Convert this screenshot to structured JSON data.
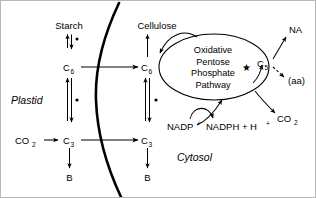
{
  "figure": {
    "type": "biochemical-pathway-diagram",
    "background_color": "#ffffff",
    "line_color": "#000000",
    "border_color": "#b8b8b8"
  },
  "compartments": [
    {
      "id": "plastid",
      "label": "Plastid"
    },
    {
      "id": "cytosol",
      "label": "Cytosol"
    }
  ],
  "membrane": {
    "name": "plastid-envelope",
    "style": "thick-curved-arc"
  },
  "metabolites": {
    "starch": "Starch",
    "cellulose": "Cellulose",
    "plastid_c6": "C",
    "plastid_c6_sub": "6",
    "plastid_c3": "C",
    "plastid_c3_sub": "3",
    "plastid_b": "B",
    "cytosol_c6": "C",
    "cytosol_c6_sub": "6",
    "cytosol_c3": "C",
    "cytosol_c3_sub": "3",
    "cytosol_b": "B",
    "c5": "C",
    "c5_sub": "5",
    "co2_in": "CO",
    "co2_in_sub": "2",
    "co2_out": "CO",
    "co2_out_sub": "2",
    "na": "NA",
    "aa": "(aa)"
  },
  "pathway": {
    "oval_label_lines": [
      "Oxidative",
      "Pentose",
      "Phosphate",
      "Pathway"
    ],
    "star_marker": "★"
  },
  "cofactors": {
    "nadp_base": "NADP",
    "nadp_charge": "+",
    "nadph_base": "NADPH + H",
    "nadph_charge": "+"
  },
  "markers": {
    "asterisk_dot": "•",
    "starch_marker": "•",
    "plastid_c6_c3_marker": "•",
    "cytosol_c6_c3_marker": "•",
    "membrane_transport_marker": "•"
  },
  "arrows": [
    {
      "name": "starch-to-c6-reversible",
      "from": "Starch",
      "to": "C6",
      "style": "double-reversible",
      "compartment": "plastid"
    },
    {
      "name": "plastid-c6-to-c3-reversible",
      "from": "C6",
      "to": "C3",
      "style": "double-reversible",
      "compartment": "plastid"
    },
    {
      "name": "co2-to-c3",
      "from": "CO2",
      "to": "C3",
      "style": "single",
      "compartment": "plastid"
    },
    {
      "name": "plastid-c3-to-b",
      "from": "C3",
      "to": "B",
      "style": "single",
      "compartment": "plastid"
    },
    {
      "name": "plastid-c6-to-cytosol-c6",
      "from": "C6",
      "to": "C6",
      "style": "single-transport",
      "compartment": "membrane"
    },
    {
      "name": "plastid-c3-to-cytosol-c3",
      "from": "C3",
      "to": "C3",
      "style": "single-transport",
      "compartment": "membrane"
    },
    {
      "name": "cytosol-c6-to-cellulose",
      "from": "C6",
      "to": "Cellulose",
      "style": "single",
      "compartment": "cytosol"
    },
    {
      "name": "cytosol-c6-to-c3-reversible",
      "from": "C6",
      "to": "C3",
      "style": "double-reversible",
      "compartment": "cytosol"
    },
    {
      "name": "cytosol-c3-to-b",
      "from": "C3",
      "to": "B",
      "style": "single",
      "compartment": "cytosol"
    },
    {
      "name": "c6-into-oppp",
      "from": "C6",
      "to": "Oxidative Pentose Phosphate Pathway",
      "style": "curved",
      "compartment": "cytosol"
    },
    {
      "name": "oppp-to-c5",
      "from": "Oxidative Pentose Phosphate Pathway",
      "to": "C5",
      "style": "curved",
      "compartment": "cytosol"
    },
    {
      "name": "c3-into-oppp",
      "from": "C3",
      "to": "Oxidative Pentose Phosphate Pathway",
      "style": "curved",
      "compartment": "cytosol"
    },
    {
      "name": "c5-to-na",
      "from": "C5",
      "to": "NA",
      "style": "single",
      "compartment": "cytosol"
    },
    {
      "name": "c5-to-aa",
      "from": "C5",
      "to": "(aa)",
      "style": "dashed",
      "compartment": "cytosol"
    },
    {
      "name": "nadp-to-nadph",
      "from": "NADP+",
      "to": "NADPH + H+",
      "style": "curved-cofactor",
      "compartment": "cytosol"
    },
    {
      "name": "oppp-to-co2",
      "from": "Oxidative Pentose Phosphate Pathway",
      "to": "CO2",
      "style": "curved",
      "compartment": "cytosol"
    }
  ]
}
